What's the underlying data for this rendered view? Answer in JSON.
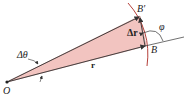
{
  "diagram": {
    "type": "vector-displacement-geometry",
    "labels": {
      "origin": "O",
      "point_b": "B",
      "point_b_prime": "B′",
      "delta_r": "Δr",
      "position_vector": "r",
      "delta_theta": "Δθ",
      "phi": "φ"
    },
    "colors": {
      "wedge_fill": "#f2c4c0",
      "wedge_stroke": "#c98a86",
      "arc": "#b5403a",
      "line": "#333333",
      "background": "#ffffff"
    }
  }
}
